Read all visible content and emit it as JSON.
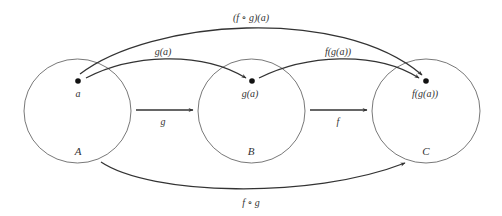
{
  "diagram": {
    "sets": [
      {
        "id": "A",
        "label": "A",
        "element_label": "a"
      },
      {
        "id": "B",
        "label": "B",
        "element_label": "g(a)"
      },
      {
        "id": "C",
        "label": "C",
        "element_label": "f(g(a))"
      }
    ],
    "arrows": [
      {
        "id": "g",
        "from": "A",
        "to": "B",
        "label": "g"
      },
      {
        "id": "f",
        "from": "B",
        "to": "C",
        "label": "f"
      },
      {
        "id": "g_a",
        "from": "a",
        "to": "g(a)",
        "label": "g(a)"
      },
      {
        "id": "f_g_a",
        "from": "g(a)",
        "to": "f(g(a))",
        "label": "f(g(a))"
      },
      {
        "id": "fog_a",
        "from": "a",
        "to": "f(g(a))",
        "label": "(f ∘ g)(a)"
      },
      {
        "id": "fog",
        "from": "A",
        "to": "C",
        "label": "f ∘ g"
      }
    ],
    "colors": {
      "stroke": "#333333",
      "circle": "#555555",
      "background": "#ffffff"
    }
  }
}
